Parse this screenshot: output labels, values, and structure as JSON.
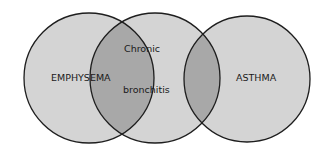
{
  "diagram": {
    "type": "venn",
    "sets": [
      {
        "id": "emphysema",
        "label": "EMPHYSEMA",
        "cx": 89,
        "cy": 78,
        "r": 65
      },
      {
        "id": "chronic_bronchitis",
        "label_line1": "Chronic",
        "label_line2": "bronchitis",
        "cx": 155,
        "cy": 78,
        "r": 65
      },
      {
        "id": "asthma",
        "label": "ASTHMA",
        "cx": 247,
        "cy": 79,
        "r": 63
      }
    ],
    "overlaps": [
      {
        "between": [
          "emphysema",
          "chronic_bronchitis"
        ]
      },
      {
        "between": [
          "chronic_bronchitis",
          "asthma"
        ]
      }
    ],
    "colors": {
      "circle_fill": "#d4d4d4",
      "overlap_fill": "#a8a8a8",
      "stroke": "#1e1e1e",
      "background": "#ffffff"
    }
  }
}
